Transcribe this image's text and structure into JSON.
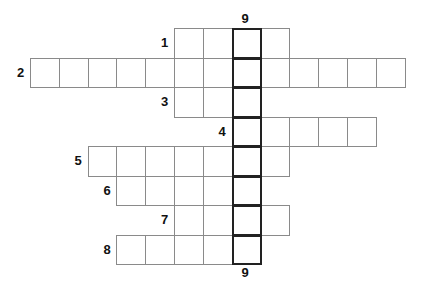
{
  "puzzle": {
    "cell_size": 29,
    "origin_x": 30,
    "origin_y": 28,
    "key_column": 7,
    "key_clue": "9",
    "rows": [
      {
        "clue": "1",
        "start_col": 5,
        "length": 4
      },
      {
        "clue": "2",
        "start_col": 0,
        "length": 13
      },
      {
        "clue": "3",
        "start_col": 5,
        "length": 3
      },
      {
        "clue": "4",
        "start_col": 7,
        "length": 5
      },
      {
        "clue": "5",
        "start_col": 2,
        "length": 7
      },
      {
        "clue": "6",
        "start_col": 3,
        "length": 5
      },
      {
        "clue": "7",
        "start_col": 5,
        "length": 4
      },
      {
        "clue": "8",
        "start_col": 3,
        "length": 5
      }
    ],
    "key_label_top": "9",
    "key_label_bottom": "9"
  }
}
